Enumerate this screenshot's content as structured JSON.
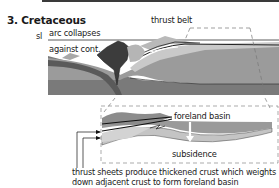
{
  "figure": {
    "title": "3. Cretaceous",
    "labels": {
      "sea_level": "sl",
      "arc_line1": "arc collapses",
      "arc_line2": "against cont.",
      "thrust_belt": "thrust belt",
      "foreland_basin": "foreland basin",
      "subsidence": "subsidence"
    },
    "caption": {
      "line1": "thrust sheets produce thickened crust which weights",
      "line2": "down adjacent crust to form foreland basin"
    },
    "colors": {
      "background": "#ffffff",
      "dark_arc": "#3c3c3c",
      "mid_gray": "#8a8a8a",
      "crust_gray": "#9a9a9a",
      "light_gray": "#c4c4c4",
      "mantle_dark": "#6e6e6e",
      "outline": "#1e1e1e"
    }
  }
}
